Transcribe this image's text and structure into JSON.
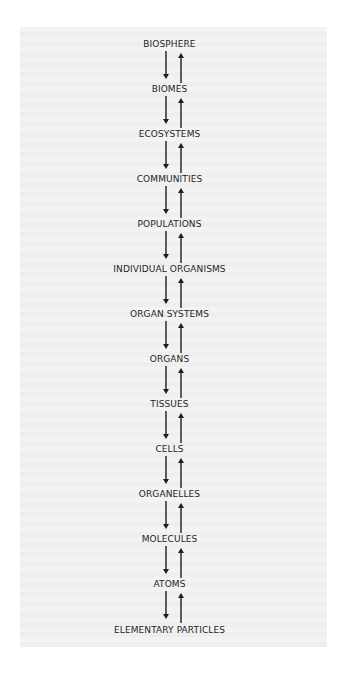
{
  "diagram": {
    "type": "hierarchy",
    "title": "",
    "direction": "vertical",
    "connector": "bidirectional-arrows",
    "colors": {
      "background": "#ffffff",
      "panel": "#f3f3f3",
      "text": "#1e1e1e",
      "arrows": "#1e1e1e"
    },
    "levels": [
      {
        "label": "BIOSPHERE"
      },
      {
        "label": "BIOMES"
      },
      {
        "label": "ECOSYSTEMS"
      },
      {
        "label": "COMMUNITIES"
      },
      {
        "label": "POPULATIONS"
      },
      {
        "label": "INDIVIDUAL ORGANISMS"
      },
      {
        "label": "ORGAN SYSTEMS"
      },
      {
        "label": "ORGANS"
      },
      {
        "label": "TISSUES"
      },
      {
        "label": "CELLS"
      },
      {
        "label": "ORGANELLES"
      },
      {
        "label": "MOLECULES"
      },
      {
        "label": "ATOMS"
      },
      {
        "label": "ELEMENTARY PARTICLES"
      }
    ],
    "edges": [
      {
        "from": "BIOSPHERE",
        "to": "BIOMES",
        "arrows": [
          "down",
          "up"
        ]
      },
      {
        "from": "BIOMES",
        "to": "ECOSYSTEMS",
        "arrows": [
          "down",
          "up"
        ]
      },
      {
        "from": "ECOSYSTEMS",
        "to": "COMMUNITIES",
        "arrows": [
          "down",
          "up"
        ]
      },
      {
        "from": "COMMUNITIES",
        "to": "POPULATIONS",
        "arrows": [
          "down",
          "up"
        ]
      },
      {
        "from": "POPULATIONS",
        "to": "INDIVIDUAL ORGANISMS",
        "arrows": [
          "down",
          "up"
        ]
      },
      {
        "from": "INDIVIDUAL ORGANISMS",
        "to": "ORGAN SYSTEMS",
        "arrows": [
          "down",
          "up"
        ]
      },
      {
        "from": "ORGAN SYSTEMS",
        "to": "ORGANS",
        "arrows": [
          "down",
          "up"
        ]
      },
      {
        "from": "ORGANS",
        "to": "TISSUES",
        "arrows": [
          "down",
          "up"
        ]
      },
      {
        "from": "TISSUES",
        "to": "CELLS",
        "arrows": [
          "down",
          "up"
        ]
      },
      {
        "from": "CELLS",
        "to": "ORGANELLES",
        "arrows": [
          "down",
          "up"
        ]
      },
      {
        "from": "ORGANELLES",
        "to": "MOLECULES",
        "arrows": [
          "down",
          "up"
        ]
      },
      {
        "from": "MOLECULES",
        "to": "ATOMS",
        "arrows": [
          "down",
          "up"
        ]
      },
      {
        "from": "ATOMS",
        "to": "ELEMENTARY PARTICLES",
        "arrows": [
          "down",
          "up"
        ]
      }
    ]
  }
}
